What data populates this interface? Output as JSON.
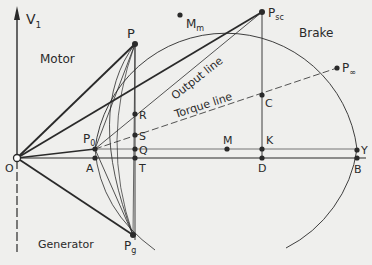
{
  "diagram": {
    "axis_label": "V",
    "axis_subscript": "1",
    "regions": {
      "motor": "Motor",
      "generator": "Generator",
      "brake": "Brake"
    },
    "lines": {
      "output": "Output line",
      "torque": "Torque line"
    },
    "points": {
      "O": {
        "label": "O",
        "sub": ""
      },
      "P": {
        "label": "P",
        "sub": ""
      },
      "Mm": {
        "label": "M",
        "sub": "m"
      },
      "Psc": {
        "label": "P",
        "sub": "sc"
      },
      "Pinf": {
        "label": "P",
        "sub": "∞"
      },
      "P0": {
        "label": "P",
        "sub": "0"
      },
      "Pg": {
        "label": "P",
        "sub": "g"
      },
      "R": {
        "label": "R",
        "sub": ""
      },
      "S": {
        "label": "S",
        "sub": ""
      },
      "Q": {
        "label": "Q",
        "sub": ""
      },
      "T": {
        "label": "T",
        "sub": ""
      },
      "A": {
        "label": "A",
        "sub": ""
      },
      "M": {
        "label": "M",
        "sub": ""
      },
      "C": {
        "label": "C",
        "sub": ""
      },
      "K": {
        "label": "K",
        "sub": ""
      },
      "D": {
        "label": "D",
        "sub": ""
      },
      "Y": {
        "label": "Y",
        "sub": ""
      },
      "B": {
        "label": "B",
        "sub": ""
      }
    },
    "colors": {
      "background": "#efefed",
      "ink": "#2a2a2a"
    }
  }
}
